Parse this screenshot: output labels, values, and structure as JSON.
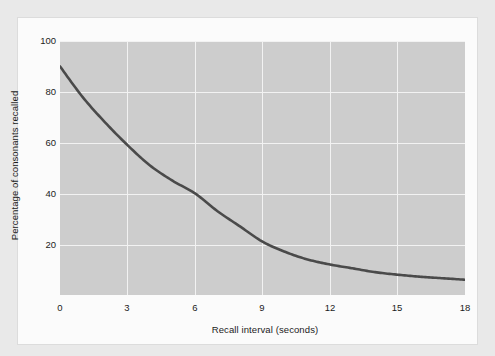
{
  "figure": {
    "background_color": "#e9e9e9",
    "panel_color": "#fbfbfb",
    "plot_fill_color": "#cdcdcd",
    "grid_color": "#f2f2f2",
    "curve_color": "#4a4a4a"
  },
  "axes": {
    "x_title": "Recall interval (seconds)",
    "y_title": "Percentage of consonants recalled",
    "x_ticks": [
      "0",
      "3",
      "6",
      "9",
      "12",
      "15",
      "18"
    ],
    "y_ticks": [
      "100",
      "80",
      "60",
      "40",
      "20"
    ]
  },
  "chart_data": {
    "type": "line",
    "title": "",
    "xlabel": "Recall interval (seconds)",
    "ylabel": "Percentage of consonants recalled",
    "xlim": [
      0,
      18
    ],
    "ylim": [
      0,
      100
    ],
    "xticks": [
      0,
      3,
      6,
      9,
      12,
      15,
      18
    ],
    "yticks": [
      20,
      40,
      60,
      80,
      100
    ],
    "grid": true,
    "legend": "none",
    "series": [
      {
        "name": "Percentage of consonants recalled",
        "color": "#4a4a4a",
        "x": [
          0,
          1,
          2,
          3,
          4,
          5,
          6,
          7,
          8,
          9,
          10,
          11,
          12,
          13,
          14,
          15,
          16,
          17,
          18
        ],
        "values": [
          90,
          78,
          68,
          59,
          51,
          45,
          40,
          33,
          27,
          21,
          17,
          14,
          12,
          10.5,
          9,
          8,
          7.2,
          6.6,
          6
        ]
      }
    ],
    "data_points": [
      {
        "x": 0,
        "y": 90
      },
      {
        "x": 3,
        "y": 59
      },
      {
        "x": 6,
        "y": 40
      },
      {
        "x": 9,
        "y": 21
      },
      {
        "x": 12,
        "y": 12
      },
      {
        "x": 15,
        "y": 8
      },
      {
        "x": 18,
        "y": 6
      }
    ]
  }
}
